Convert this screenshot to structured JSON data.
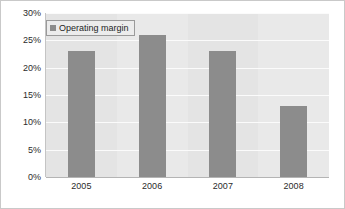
{
  "chart_data": {
    "type": "bar",
    "title": "",
    "subtitle": "",
    "xlabel": "",
    "ylabel": "",
    "categories": [
      "2005",
      "2006",
      "2007",
      "2008"
    ],
    "series": [
      {
        "name": "Operating margin",
        "values": [
          23,
          26,
          23,
          13
        ]
      }
    ],
    "ylim": [
      0,
      30
    ],
    "ytick_step": 5,
    "ytick_labels": [
      "0%",
      "5%",
      "10%",
      "15%",
      "20%",
      "25%",
      "30%"
    ],
    "ytick_values": [
      0,
      5,
      10,
      15,
      20,
      25,
      30
    ],
    "grid": "horizontal",
    "legend_position": "top-left",
    "colors": {
      "bar": "#8c8c8c",
      "plot_background": "#e4e4e4",
      "plot_background_alt": "#e9e9e9",
      "gridline": "#fbfbfb",
      "axis_line": "#b4b4b4",
      "frame_border": "#c9c9c9",
      "legend_background": "#ececec",
      "legend_border": "#9a9a9a",
      "text": "#2b2b2b"
    }
  },
  "legend": {
    "items": [
      {
        "label": "Operating margin",
        "marker": "square-marker-icon"
      }
    ]
  }
}
